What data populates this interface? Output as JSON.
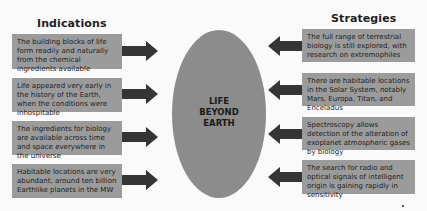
{
  "colors": {
    "background": "#fafafa",
    "box_fill": "#9b9b9b",
    "ellipse_fill": "#8c8c8c",
    "arrow_fill": "#353535",
    "text": "#1e1e1e"
  },
  "indications": {
    "heading": "Indications",
    "items": [
      {
        "text": "The building blocks of life form readily and naturally from the chemical ingredients available"
      },
      {
        "text": "Life appeared very early in the history of the Earth, when the conditions were inhospitable"
      },
      {
        "text": "The ingredients for biology are available across time and space everywhere in the universe"
      },
      {
        "text": "Habitable locations are very abundant, around ten billion Earthlike planets in the MW"
      }
    ]
  },
  "center": {
    "lines": [
      "LIFE",
      "BEYOND",
      "EARTH"
    ]
  },
  "strategies": {
    "heading": "Strategies",
    "items": [
      {
        "text": "The full range of terrestrial biology is still explored, with research on extremophiles"
      },
      {
        "text": "There are habitable locations in the Solar System, notably Mars, Europa, Titan, and Enceladus"
      },
      {
        "text": "Spectroscopy allows detection of the alteration of exoplanet atmospheric gases by biology"
      },
      {
        "text": "The search for radio and optical signals of intelligent origin is gaining rapidly in sensitivity"
      }
    ]
  }
}
